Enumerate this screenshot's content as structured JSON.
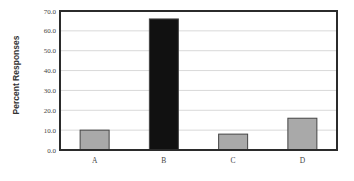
{
  "chart_data": {
    "type": "bar",
    "title": "",
    "xlabel": "",
    "ylabel": "Percent Responses",
    "categories": [
      "A",
      "B",
      "C",
      "D"
    ],
    "values": [
      10.0,
      66.0,
      8.0,
      16.0
    ],
    "bar_colors": [
      "#a9a9a9",
      "#111111",
      "#a9a9a9",
      "#a9a9a9"
    ],
    "ylim": [
      0,
      70
    ],
    "yticks": [
      0,
      10,
      20,
      30,
      40,
      50,
      60,
      70
    ],
    "ytick_labels": [
      "0.0",
      "10.0",
      "20.0",
      "30.0",
      "40.0",
      "50.0",
      "60.0",
      "70.0"
    ],
    "grid": true,
    "legend": null
  },
  "colors": {
    "axis": "#2b2b2b",
    "grid": "#d9d9d9",
    "bar_default": "#a9a9a9",
    "bar_highlight": "#111111",
    "bar_edge": "#444444"
  }
}
